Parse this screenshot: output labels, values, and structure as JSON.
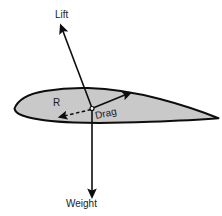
{
  "diagram": {
    "background_color": "#ffffff",
    "airfoil": {
      "name": "airfoil-cross-section",
      "fill_color": "#c9c9c9",
      "stroke_color": "#0d0d0d",
      "leading_edge": [
        14,
        108
      ],
      "trailing_edge": [
        218,
        118
      ],
      "upper_peak": [
        85,
        88
      ]
    },
    "origin_point": {
      "name": "center-of-pressure",
      "x": 92,
      "y": 108,
      "marker": "small-circle"
    },
    "vectors": [
      {
        "id": "lift",
        "label": "Lift",
        "style": "solid",
        "color": "#0d0d0d",
        "from": [
          92,
          108
        ],
        "to": [
          62,
          29
        ],
        "label_pos": [
          55,
          18
        ]
      },
      {
        "id": "weight",
        "label": "Weight",
        "style": "solid",
        "color": "#0d0d0d",
        "from": [
          92,
          108
        ],
        "to": [
          92,
          194
        ],
        "label_pos": [
          67,
          207
        ]
      },
      {
        "id": "drag",
        "label": "Drag",
        "style": "solid",
        "color": "#0d0d0d",
        "from": [
          92,
          108
        ],
        "to": [
          129,
          93
        ],
        "label_pos": [
          96,
          119
        ],
        "label_rotation": -14
      },
      {
        "id": "resultant",
        "label": "R",
        "style": "dashed",
        "color": "#0d0d0d",
        "from": [
          92,
          109
        ],
        "to": [
          61,
          117
        ],
        "label_pos": [
          53,
          106
        ]
      }
    ]
  }
}
